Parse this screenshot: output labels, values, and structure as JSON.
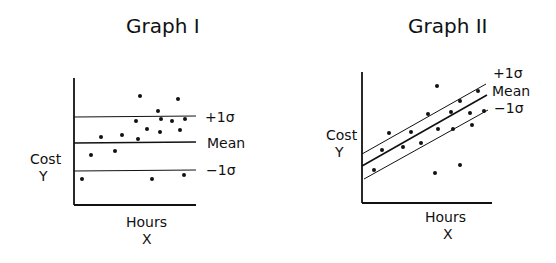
{
  "graphs": [
    {
      "title": "Graph I",
      "y_label_line1": "Cost",
      "y_label_line2": "Y",
      "x_label_line1": "Hours",
      "x_label_line2": "X",
      "band_labels": {
        "plus": "+1σ",
        "mean": "Mean",
        "minus": "−1σ"
      },
      "axes": {
        "x0": 74,
        "y0": 205,
        "xEnd": 196,
        "yTop": 78
      },
      "lines": {
        "plus": {
          "x1": 74,
          "y1": 117,
          "x2": 196,
          "y2": 116
        },
        "mean": {
          "x1": 74,
          "y1": 143,
          "x2": 196,
          "y2": 142
        },
        "minus": {
          "x1": 74,
          "y1": 171,
          "x2": 196,
          "y2": 170
        }
      },
      "label_pos": {
        "plus": [
          205,
          122
        ],
        "mean": [
          207,
          148
        ],
        "minus": [
          206,
          175
        ]
      },
      "points": [
        [
          82,
          179
        ],
        [
          91,
          155
        ],
        [
          101,
          137
        ],
        [
          115,
          151
        ],
        [
          122,
          135
        ],
        [
          136,
          121
        ],
        [
          138,
          139
        ],
        [
          140,
          96
        ],
        [
          147,
          129
        ],
        [
          158,
          111
        ],
        [
          160,
          132
        ],
        [
          161,
          119
        ],
        [
          152,
          179
        ],
        [
          172,
          121
        ],
        [
          178,
          99
        ],
        [
          180,
          130
        ],
        [
          185,
          119
        ],
        [
          184,
          175
        ]
      ]
    },
    {
      "title": "Graph II",
      "y_label_line1": "Cost",
      "y_label_line2": "Y",
      "x_label_line1": "Hours",
      "x_label_line2": "X",
      "band_labels": {
        "plus": "+1σ",
        "mean": "Mean",
        "minus": "−1σ"
      },
      "axes": {
        "x0": 362,
        "y0": 203,
        "xEnd": 492,
        "yTop": 72
      },
      "lines": {
        "plus": {
          "x1": 362,
          "y1": 154,
          "x2": 486,
          "y2": 84
        },
        "mean": {
          "x1": 362,
          "y1": 166,
          "x2": 487,
          "y2": 95
        },
        "minus": {
          "x1": 364,
          "y1": 179,
          "x2": 488,
          "y2": 110
        }
      },
      "label_pos": {
        "plus": [
          493,
          78
        ],
        "mean": [
          492,
          96
        ],
        "minus": [
          494,
          113
        ]
      },
      "points": [
        [
          374,
          170
        ],
        [
          382,
          150
        ],
        [
          389,
          133
        ],
        [
          403,
          147
        ],
        [
          411,
          132
        ],
        [
          421,
          143
        ],
        [
          428,
          114
        ],
        [
          437,
          86
        ],
        [
          438,
          129
        ],
        [
          435,
          173
        ],
        [
          451,
          112
        ],
        [
          453,
          129
        ],
        [
          460,
          101
        ],
        [
          460,
          165
        ],
        [
          470,
          113
        ],
        [
          472,
          125
        ],
        [
          478,
          91
        ],
        [
          484,
          111
        ]
      ]
    }
  ],
  "chart_data": [
    {
      "type": "scatter",
      "title": "Graph I",
      "xlabel": "Hours X",
      "ylabel": "Cost Y",
      "description": "Scatter of cost vs hours with horizontal mean line and ±1σ bands (no relationship)",
      "lines": [
        "+1σ (horizontal)",
        "Mean (horizontal)",
        "−1σ (horizontal)"
      ],
      "points_relative": [
        [
          0.07,
          0.2
        ],
        [
          0.14,
          0.39
        ],
        [
          0.22,
          0.54
        ],
        [
          0.34,
          0.43
        ],
        [
          0.39,
          0.55
        ],
        [
          0.51,
          0.66
        ],
        [
          0.52,
          0.52
        ],
        [
          0.54,
          0.87
        ],
        [
          0.6,
          0.59
        ],
        [
          0.69,
          0.74
        ],
        [
          0.7,
          0.57
        ],
        [
          0.71,
          0.68
        ],
        [
          0.64,
          0.2
        ],
        [
          0.8,
          0.66
        ],
        [
          0.85,
          0.83
        ],
        [
          0.87,
          0.59
        ],
        [
          0.91,
          0.68
        ],
        [
          0.9,
          0.24
        ]
      ]
    },
    {
      "type": "scatter",
      "title": "Graph II",
      "xlabel": "Hours X",
      "ylabel": "Cost Y",
      "description": "Scatter of cost vs hours with upward-sloping regression line and parallel ±1σ bands",
      "lines": [
        "+1σ (sloped)",
        "Mean (sloped)",
        "−1σ (sloped)"
      ],
      "points_relative": [
        [
          0.09,
          0.25
        ],
        [
          0.15,
          0.4
        ],
        [
          0.21,
          0.53
        ],
        [
          0.32,
          0.43
        ],
        [
          0.38,
          0.54
        ],
        [
          0.45,
          0.46
        ],
        [
          0.51,
          0.68
        ],
        [
          0.58,
          0.89
        ],
        [
          0.58,
          0.56
        ],
        [
          0.56,
          0.23
        ],
        [
          0.68,
          0.69
        ],
        [
          0.7,
          0.56
        ],
        [
          0.75,
          0.78
        ],
        [
          0.75,
          0.29
        ],
        [
          0.83,
          0.69
        ],
        [
          0.85,
          0.6
        ],
        [
          0.89,
          0.85
        ],
        [
          0.94,
          0.7
        ]
      ]
    }
  ]
}
